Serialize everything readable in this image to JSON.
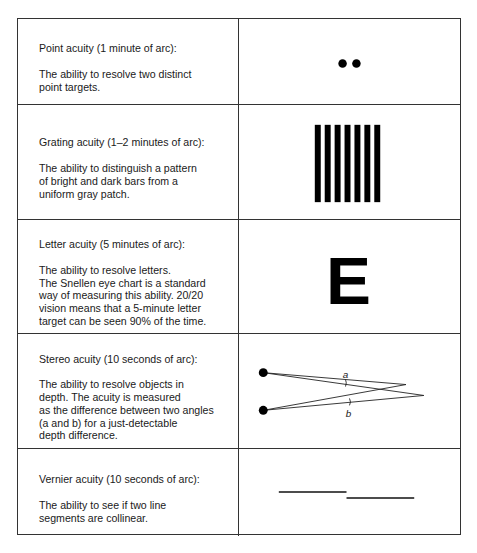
{
  "rows": [
    {
      "title": "Point acuity (1 minute of arc):",
      "description": "The ability to resolve two distinct\npoint targets.",
      "figure": "two-dots"
    },
    {
      "title": "Grating acuity (1–2 minutes of arc):",
      "description": "The ability to distinguish a pattern\nof bright and dark bars from a\nuniform gray patch.",
      "figure": "grating-bars",
      "bar_count": 7
    },
    {
      "title": "Letter acuity (5 minutes of arc):",
      "description": "The ability to resolve letters.\nThe Snellen eye chart is a standard\nway of measuring this ability. 20/20\nvision means that a 5-minute letter\ntarget can be seen 90% of the time.",
      "figure": "snellen-letter",
      "letter": "E"
    },
    {
      "title": "Stereo acuity (10 seconds of arc):",
      "description": "The ability to resolve objects in\ndepth. The acuity is measured\nas the difference between two angles\n(a and b) for a just-detectable\ndepth difference.",
      "figure": "stereo-angles",
      "angle_labels": [
        "a",
        "b"
      ]
    },
    {
      "title": "Vernier acuity (10 seconds of arc):",
      "description": "The ability to see if two line\nsegments are collinear.",
      "figure": "vernier-lines"
    }
  ]
}
